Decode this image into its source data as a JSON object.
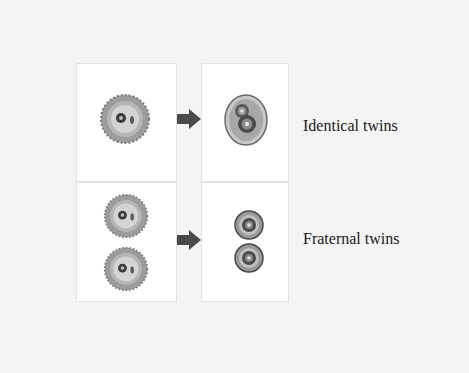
{
  "diagram": {
    "rows": [
      {
        "label": "Identical twins",
        "source": "single-egg-cell",
        "result": "two-embryos-shared-membrane"
      },
      {
        "label": "Fraternal twins",
        "source": "two-egg-cells",
        "result": "two-separate-embryos"
      }
    ],
    "icons": {
      "arrow": "right-arrow-icon"
    },
    "colors": {
      "background": "#f4f4f4",
      "panel": "#ffffff",
      "arrow": "#4a4a4a",
      "cell_gray": "#9a9a9a"
    }
  }
}
